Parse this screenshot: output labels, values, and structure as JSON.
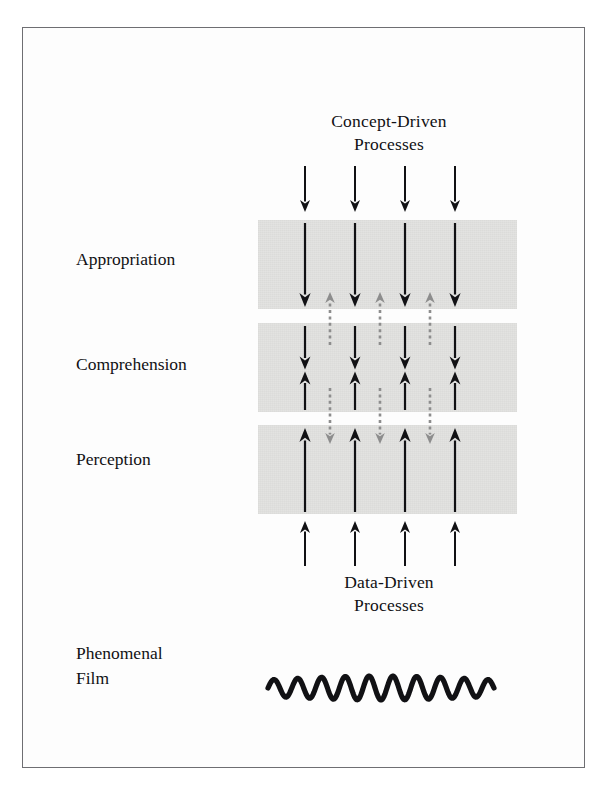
{
  "figure": {
    "frame_color": "#6e6e72",
    "band_color": "#e3e3e1",
    "arrow_color": "#111114",
    "dashed_arrow_color": "#8d8d8d",
    "background": "#ffffff"
  },
  "titles": {
    "top": "Concept-Driven\nProcesses",
    "bottom": "Data-Driven\nProcesses"
  },
  "band_labels": [
    {
      "id": "appropriation",
      "text": "Appropriation"
    },
    {
      "id": "comprehension",
      "text": "Comprehension"
    },
    {
      "id": "perception",
      "text": "Perception"
    }
  ],
  "film_label": "Phenomenal\nFilm",
  "chart_data": {
    "type": "diagram",
    "levels": [
      {
        "name": "Appropriation",
        "order": 1,
        "band_top": 220,
        "band_height": 89,
        "internal_arrows": "downward"
      },
      {
        "name": "Comprehension",
        "order": 2,
        "band_top": 323,
        "band_height": 89,
        "internal_arrows": "downward-and-upward"
      },
      {
        "name": "Perception",
        "order": 3,
        "band_top": 425,
        "band_height": 89,
        "internal_arrows": "upward"
      }
    ],
    "columns_x": [
      305,
      355,
      405,
      455
    ],
    "dashed_columns_x": [
      330,
      380,
      430
    ],
    "band_left": 258,
    "band_width": 259,
    "flows": [
      {
        "name": "concept-driven",
        "direction": "down",
        "color": "#111114",
        "style": "solid"
      },
      {
        "name": "data-driven",
        "direction": "up",
        "color": "#111114",
        "style": "solid"
      },
      {
        "name": "feedback-appropriation-to-comprehension",
        "direction": "up",
        "color": "#8d8d8d",
        "style": "dashed"
      },
      {
        "name": "feedback-comprehension-to-perception",
        "direction": "down",
        "color": "#8d8d8d",
        "style": "dashed"
      }
    ],
    "wave": {
      "cycles": 9.5,
      "x_start": 272,
      "x_end": 492,
      "y_center": 685
    }
  }
}
